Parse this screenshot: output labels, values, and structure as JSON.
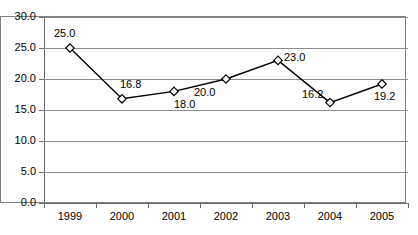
{
  "chart_data": {
    "type": "line",
    "title": "",
    "subtitle": "",
    "xlabel": "",
    "ylabel": "",
    "categories": [
      "1999",
      "2000",
      "2001",
      "2002",
      "2003",
      "2004",
      "2005"
    ],
    "values": [
      25.0,
      16.8,
      18.0,
      20.0,
      23.0,
      16.2,
      19.2
    ],
    "point_labels": [
      "25.0",
      "16.8",
      "18.0",
      "20.0",
      "23.0",
      "16.2",
      "19.2"
    ],
    "series": [
      {
        "name": "",
        "values": [
          25.0,
          16.8,
          18.0,
          20.0,
          23.0,
          16.2,
          19.2
        ]
      }
    ],
    "ylim": [
      0.0,
      30.0
    ],
    "ytick_values": [
      30.0,
      25.0,
      20.0,
      15.0,
      10.0,
      5.0,
      0.0
    ],
    "ytick_labels": [
      "30.0",
      "25.0",
      "20.0",
      "15.0",
      "10.0",
      "5.0",
      "0.0"
    ],
    "ystep": 5.0,
    "grid": "horizontal",
    "legend": "none",
    "marker": "diamond-open",
    "line_color": "#000000",
    "marker_color": "#ffffff",
    "gridline_color": "#8c8c8c",
    "axis_color": "#6b6b6b",
    "plot_background": "#ffffff"
  }
}
